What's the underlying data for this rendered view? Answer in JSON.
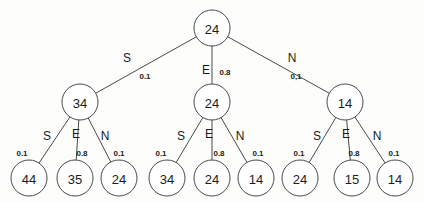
{
  "diagram": {
    "type": "tree",
    "stroke_color": "#4a4a4a",
    "text_color": "#1b1b1b",
    "background_color": "#fdfdfc",
    "root": {
      "id": "root",
      "value": "24",
      "cx": 212,
      "cy": 28,
      "r": 18
    },
    "level1": [
      {
        "id": "n-left",
        "value": "34",
        "cx": 80,
        "cy": 102,
        "r": 18
      },
      {
        "id": "n-mid",
        "value": "24",
        "cx": 212,
        "cy": 102,
        "r": 18
      },
      {
        "id": "n-right",
        "value": "14",
        "cx": 345,
        "cy": 102,
        "r": 18
      }
    ],
    "leaves": [
      {
        "id": "leaf-1",
        "value": "44",
        "cx": 29,
        "cy": 178,
        "r": 18
      },
      {
        "id": "leaf-2",
        "value": "35",
        "cx": 75,
        "cy": 178,
        "r": 18
      },
      {
        "id": "leaf-3",
        "value": "24",
        "cx": 119,
        "cy": 178,
        "r": 18
      },
      {
        "id": "leaf-4",
        "value": "34",
        "cx": 167,
        "cy": 178,
        "r": 18
      },
      {
        "id": "leaf-5",
        "value": "24",
        "cx": 212,
        "cy": 178,
        "r": 18
      },
      {
        "id": "leaf-6",
        "value": "14",
        "cx": 256,
        "cy": 178,
        "r": 18
      },
      {
        "id": "leaf-7",
        "value": "24",
        "cx": 300,
        "cy": 178,
        "r": 18
      },
      {
        "id": "leaf-8",
        "value": "15",
        "cx": 352,
        "cy": 178,
        "r": 18
      },
      {
        "id": "leaf-9",
        "value": "14",
        "cx": 395,
        "cy": 178,
        "r": 18
      }
    ],
    "root_edges": [
      {
        "id": "root-edge-s",
        "action": "S",
        "action_x": 127,
        "action_y": 58,
        "prob": "0.1",
        "prob_x": 145,
        "prob_y": 76
      },
      {
        "id": "root-edge-e",
        "action": "E",
        "action_x": 206,
        "action_y": 70,
        "prob": "0.8",
        "prob_x": 225,
        "prob_y": 72
      },
      {
        "id": "root-edge-n",
        "action": "N",
        "action_x": 292,
        "action_y": 58,
        "prob": "0,1",
        "prob_x": 296,
        "prob_y": 76
      }
    ],
    "branch_edges": [
      {
        "id": "left-edge-s",
        "action": "S",
        "action_x": 47,
        "action_y": 136,
        "prob": "0.1",
        "prob_x": 22,
        "prob_y": 153
      },
      {
        "id": "left-edge-e",
        "action": "E",
        "action_x": 76,
        "action_y": 134,
        "prob": "0.8",
        "prob_x": 82,
        "prob_y": 153
      },
      {
        "id": "left-edge-n",
        "action": "N",
        "action_x": 105,
        "action_y": 136,
        "prob": "0.1",
        "prob_x": 119,
        "prob_y": 153
      },
      {
        "id": "mid-edge-s",
        "action": "S",
        "action_x": 181,
        "action_y": 136,
        "prob": "0.1",
        "prob_x": 161,
        "prob_y": 153
      },
      {
        "id": "mid-edge-e",
        "action": "E",
        "action_x": 209,
        "action_y": 134,
        "prob": "0.8",
        "prob_x": 219,
        "prob_y": 153
      },
      {
        "id": "mid-edge-n",
        "action": "N",
        "action_x": 240,
        "action_y": 136,
        "prob": "0.1",
        "prob_x": 258,
        "prob_y": 153
      },
      {
        "id": "right-edge-s",
        "action": "S",
        "action_x": 317,
        "action_y": 136,
        "prob": "0.1",
        "prob_x": 299,
        "prob_y": 153
      },
      {
        "id": "right-edge-e",
        "action": "E",
        "action_x": 346,
        "action_y": 134,
        "prob": "0.8",
        "prob_x": 354,
        "prob_y": 153
      },
      {
        "id": "right-edge-n",
        "action": "N",
        "action_x": 377,
        "action_y": 136,
        "prob": "0.1",
        "prob_x": 394,
        "prob_y": 153
      }
    ]
  }
}
